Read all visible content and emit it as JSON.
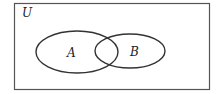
{
  "diagram": {
    "type": "venn",
    "universe_label": "U",
    "sets": [
      {
        "label": "A"
      },
      {
        "label": "B"
      }
    ],
    "colors": {
      "stroke": "#333333",
      "background": "#ffffff"
    }
  }
}
